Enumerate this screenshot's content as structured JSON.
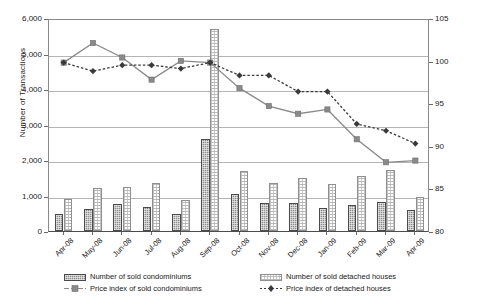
{
  "chart_data": {
    "type": "bar",
    "title": "",
    "xlabel": "",
    "ylabel": "Number of  Transactions",
    "y2label": "",
    "grid": true,
    "legend_position": "bottom",
    "categories": [
      "Apr-08",
      "May-08",
      "Jun-08",
      "Jul-08",
      "Aug-08",
      "Sep-08",
      "Oct-08",
      "Nov-08",
      "Dec-08",
      "Jan-09",
      "Feb-09",
      "Mar-09",
      "Apr-09"
    ],
    "ylim": [
      0,
      6000
    ],
    "yticks": [
      "0",
      "1,000",
      "2,000",
      "3,000",
      "4,000",
      "5,000",
      "6,000"
    ],
    "y2lim": [
      80,
      105
    ],
    "y2ticks": [
      "80",
      "85",
      "90",
      "95",
      "100",
      "105"
    ],
    "series": [
      {
        "name": "Number of sold condominiums",
        "kind": "bar",
        "axis": "left",
        "color": "#8c8c8c",
        "values": [
          480,
          630,
          750,
          670,
          480,
          2600,
          1030,
          800,
          800,
          640,
          740,
          830,
          580
        ]
      },
      {
        "name": "Number of sold detached houses",
        "kind": "bar",
        "axis": "left",
        "color": "#ffffff",
        "values": [
          900,
          1210,
          1250,
          1350,
          880,
          5700,
          1700,
          1340,
          1480,
          1330,
          1560,
          1720,
          950
        ]
      },
      {
        "name": "Price index of sold condominiums",
        "kind": "line",
        "axis": "right",
        "color": "#8a8a8a",
        "marker": "square",
        "dash": "solid",
        "values": [
          100.0,
          102.3,
          100.6,
          98.0,
          100.2,
          100.0,
          97.0,
          94.9,
          94.0,
          94.5,
          91.0,
          88.3,
          88.5
        ]
      },
      {
        "name": "Price index of detached houses",
        "kind": "line",
        "axis": "right",
        "color": "#3a3a3a",
        "marker": "diamond",
        "dash": "dotted",
        "values": [
          100.0,
          99.0,
          99.7,
          99.7,
          99.3,
          100.0,
          98.5,
          98.5,
          96.6,
          96.6,
          92.8,
          92.0,
          90.5
        ]
      }
    ]
  },
  "legend": {
    "row1": [
      {
        "label": "Number of sold condominiums",
        "key": "condo-bar-key"
      },
      {
        "label": "Number of sold detached houses",
        "key": "detached-bar-key"
      }
    ],
    "row2": [
      {
        "label": "Price index of sold condominiums",
        "key": "condo-line-key"
      },
      {
        "label": "Price index of detached houses",
        "key": "detached-line-key"
      }
    ]
  }
}
